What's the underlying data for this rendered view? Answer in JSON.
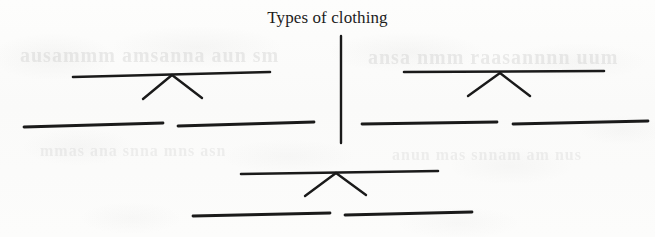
{
  "document": {
    "kind": "worksheet-tree-diagram",
    "title": "Types of clothing",
    "background_color": "#fbfbfa",
    "ink_color": "#1a1a1a"
  },
  "ghost_bleed_through": {
    "note": "faint illegible show-through text from the reverse side of the scanned page",
    "row_a": "ausammm  amsanna  aun  sm",
    "row_b": "ansa  nmm  raasannnn  uum",
    "row_c": "mmas  ana  snna  mns  asn",
    "row_d": "anun  mas  snnam  am  nus"
  },
  "diagram": {
    "root": {
      "label": "Types of clothing",
      "stem": {
        "x": 341,
        "y_top": 36,
        "y_bottom": 143
      }
    },
    "branches": [
      {
        "name": "left-branch",
        "crossbar": {
          "x1": 73,
          "y1": 77,
          "x2": 270,
          "y2": 72
        },
        "connector_apex": {
          "x": 172,
          "y": 75
        },
        "connector_legs": [
          {
            "x": 143,
            "y": 99
          },
          {
            "x": 202,
            "y": 98
          }
        ],
        "answer_lines": [
          {
            "x1": 24,
            "y1": 127,
            "x2": 163,
            "y2": 123
          },
          {
            "x1": 178,
            "y1": 126,
            "x2": 314,
            "y2": 122
          }
        ]
      },
      {
        "name": "right-branch",
        "crossbar": {
          "x1": 404,
          "y1": 72,
          "x2": 604,
          "y2": 71
        },
        "connector_apex": {
          "x": 500,
          "y": 73
        },
        "connector_legs": [
          {
            "x": 468,
            "y": 96
          },
          {
            "x": 530,
            "y": 96
          }
        ],
        "answer_lines": [
          {
            "x1": 362,
            "y1": 124,
            "x2": 497,
            "y2": 122
          },
          {
            "x1": 513,
            "y1": 124,
            "x2": 648,
            "y2": 121
          }
        ]
      },
      {
        "name": "bottom-branch",
        "crossbar": {
          "x1": 241,
          "y1": 174,
          "x2": 438,
          "y2": 171
        },
        "connector_apex": {
          "x": 336,
          "y": 173
        },
        "connector_legs": [
          {
            "x": 305,
            "y": 196
          },
          {
            "x": 366,
            "y": 195
          }
        ],
        "answer_lines": [
          {
            "x1": 193,
            "y1": 216,
            "x2": 330,
            "y2": 213
          },
          {
            "x1": 345,
            "y1": 215,
            "x2": 472,
            "y2": 212
          }
        ]
      }
    ],
    "blank_answer_line_count": 6
  }
}
